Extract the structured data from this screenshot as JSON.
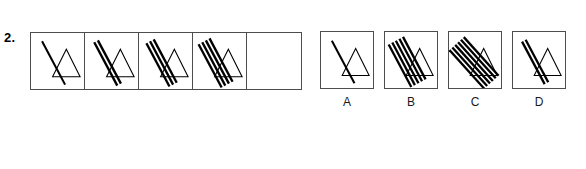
{
  "question": {
    "number": "2.",
    "type": "non-verbal-sequence"
  },
  "figure_spec": {
    "triangle_points": "22,44 36,16 50,44",
    "line_angle_deg_steep": 62,
    "line_angle_deg_shallow": 48,
    "stroke_color": "#000000",
    "box_border_color": "#4d4d4d",
    "background_color": "#ffffff"
  },
  "sequence": {
    "name": "sequence-strip",
    "cells": [
      {
        "id": "cell-1",
        "line_count": 1,
        "empty": false,
        "label": ""
      },
      {
        "id": "cell-2",
        "line_count": 2,
        "empty": false,
        "label": ""
      },
      {
        "id": "cell-3",
        "line_count": 3,
        "empty": false,
        "label": ""
      },
      {
        "id": "cell-4",
        "line_count": 4,
        "empty": false,
        "label": ""
      },
      {
        "id": "cell-5",
        "line_count": 0,
        "empty": true,
        "label": ""
      }
    ]
  },
  "options": [
    {
      "id": "option-a",
      "label": "A",
      "line_count": 1,
      "angle": "steep"
    },
    {
      "id": "option-b",
      "label": "B",
      "line_count": 5,
      "angle": "steep"
    },
    {
      "id": "option-c",
      "label": "C",
      "line_count": 6,
      "angle": "shallow"
    },
    {
      "id": "option-d",
      "label": "D",
      "line_count": 2,
      "angle": "steep"
    }
  ]
}
